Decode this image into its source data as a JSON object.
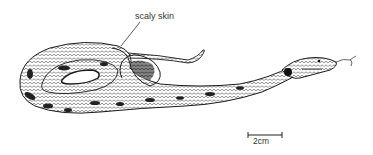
{
  "figure": {
    "annotations": [
      {
        "id": "scaly-skin",
        "text": "scaly skin"
      }
    ],
    "scale_bar": {
      "label": "2cm"
    }
  },
  "colors": {
    "ink": "#1a1a1a",
    "shade": "#555555",
    "background": "#ffffff",
    "label": "#333333"
  }
}
